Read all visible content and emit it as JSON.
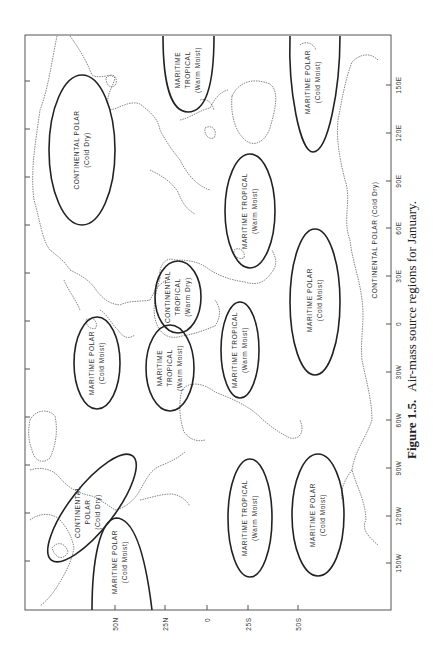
{
  "figure": {
    "number": "Figure 1.5.",
    "caption": "Air-mass source regions for January.",
    "orientation": "rotated 90° counter-clockwise"
  },
  "axes": {
    "latitude_ticks": [
      "50N",
      "25N",
      "0",
      "25S",
      "50S"
    ],
    "longitude_ticks": [
      "150W",
      "120W",
      "90W",
      "60W",
      "30W",
      "0",
      "30E",
      "60E",
      "90E",
      "120E",
      "150E"
    ]
  },
  "regions": [
    {
      "id": "cp-asia",
      "line1": "CONTINENTAL POLAR",
      "line2": "",
      "line3": "(Cold Dry)"
    },
    {
      "id": "mt-w-pacific",
      "line1": "MARITIME",
      "line2": "TROPICAL",
      "line3": "(Warm Moist)"
    },
    {
      "id": "mp-nw-pacific",
      "line1": "MARITIME POLAR",
      "line2": "",
      "line3": "(Cold Moist)"
    },
    {
      "id": "mt-indian",
      "line1": "MARITIME TROPICAL",
      "line2": "",
      "line3": "(Warm Moist)"
    },
    {
      "id": "mp-s-indian",
      "line1": "MARITIME POLAR",
      "line2": "",
      "line3": "(Cold Moist)"
    },
    {
      "id": "ct-africa",
      "line1": "CONTINENTAL",
      "line2": "TROPICAL",
      "line3": "(Warm Dry)"
    },
    {
      "id": "mt-s-atlantic",
      "line1": "MARITIME TROPICAL",
      "line2": "",
      "line3": "(Warm Moist)"
    },
    {
      "id": "mp-n-atlantic",
      "line1": "MARITIME POLAR",
      "line2": "",
      "line3": "(Cold Moist)"
    },
    {
      "id": "mt-n-atlantic",
      "line1": "MARITIME",
      "line2": "TROPICAL",
      "line3": "(Warm Moist)"
    },
    {
      "id": "cp-n-america",
      "line1": "CONTINENTAL",
      "line2": "POLAR",
      "line3": "(Cold Dry)"
    },
    {
      "id": "mp-ne-pacific",
      "line1": "MARITIME POLAR",
      "line2": "",
      "line3": "(Cold Moist)"
    },
    {
      "id": "mt-s-pacific",
      "line1": "MARITIME TROPICAL",
      "line2": "",
      "line3": "(Warm Moist)"
    },
    {
      "id": "mp-s-pacific",
      "line1": "MARITIME POLAR",
      "line2": "",
      "line3": "(Cold Moist)"
    },
    {
      "id": "cp-antarctica",
      "line1": "CONTINENTAL POLAR (Cold Dry)",
      "line2": "",
      "line3": ""
    }
  ]
}
